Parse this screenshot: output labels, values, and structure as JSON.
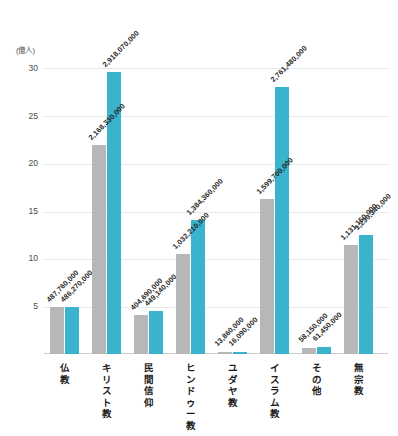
{
  "chart_data": {
    "type": "bar",
    "title": "",
    "subtitle": "",
    "xlabel": "",
    "ylabel": "",
    "unit_label": "(億人)",
    "ylim": [
      0,
      30
    ],
    "yticks": [
      30,
      25,
      20,
      15,
      10,
      5
    ],
    "grid": true,
    "legend_position": "none",
    "categories": [
      "仏教",
      "キリスト教",
      "民間信仰",
      "ヒンドゥー教",
      "ユダヤ教",
      "イスラム教",
      "その他",
      "無宗教"
    ],
    "series": [
      {
        "name": "gray",
        "color": "#b7b7b7",
        "values": [
          4.8776,
          21.6833,
          4.0469,
          10.3221,
          0.1386,
          15.997,
          0.5815,
          11.3115
        ],
        "labels": [
          "487,760,000",
          "2,168,330,000",
          "404,690,000",
          "1,032,210,000",
          "13,860,000",
          "1,599,700,000",
          "58,150,000",
          "1,131,150,000"
        ]
      },
      {
        "name": "teal",
        "color": "#3ab3cd",
        "values": [
          4.8627,
          29.1807,
          4.4914,
          13.8436,
          0.1609,
          27.6148,
          0.6145,
          12.3034
        ],
        "labels": [
          "486,270,000",
          "2,918,070,000",
          "449,140,000",
          "1,384,360,000",
          "16,090,000",
          "2,761,480,000",
          "61,450,000",
          "1,230,340,000"
        ]
      }
    ]
  },
  "axis": {
    "unit": "(億人)",
    "t30": "30",
    "t25": "25",
    "t20": "20",
    "t15": "15",
    "t10": "10",
    "t5": "5"
  },
  "categories": {
    "c0": "仏教",
    "c1": "キリスト教",
    "c2": "民間信仰",
    "c3": "ヒンドゥー教",
    "c4": "ユダヤ教",
    "c5": "イスラム教",
    "c6": "その他",
    "c7": "無宗教"
  },
  "labels": {
    "g0": "487,760,000",
    "t0": "486,270,000",
    "g1": "2,168,330,000",
    "t1": "2,918,070,000",
    "g2": "404,690,000",
    "t2": "449,140,000",
    "g3": "1,032,210,000",
    "t3": "1,384,360,000",
    "g4": "13,860,000",
    "t4": "16,090,000",
    "g5": "1,599,700,000",
    "t5": "2,761,480,000",
    "g6": "58,150,000",
    "t6": "61,450,000",
    "g7": "1,131,150,000",
    "t7": "1,230,340,000"
  }
}
